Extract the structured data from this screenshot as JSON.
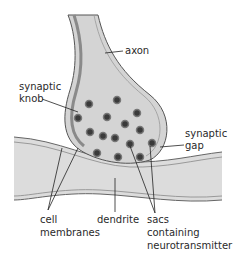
{
  "diagram": {
    "labels": {
      "axon": "axon",
      "synaptic_knob_line1": "synaptic",
      "synaptic_knob_line2": "knob",
      "synaptic_gap_line1": "synaptic",
      "synaptic_gap_line2": "gap",
      "cell_membranes_line1": "cell",
      "cell_membranes_line2": "membranes",
      "dendrite": "dendrite",
      "sacs_line1": "sacs",
      "sacs_line2": "containing",
      "sacs_line3": "neurotransmitter"
    },
    "colors": {
      "tissue_fill": "#d9d9d9",
      "membrane_dark": "#8a8a8a",
      "outline": "#555555",
      "vesicle_core": "#3a3a3a",
      "text": "#2a2a2a"
    },
    "vesicle_count": 15
  }
}
